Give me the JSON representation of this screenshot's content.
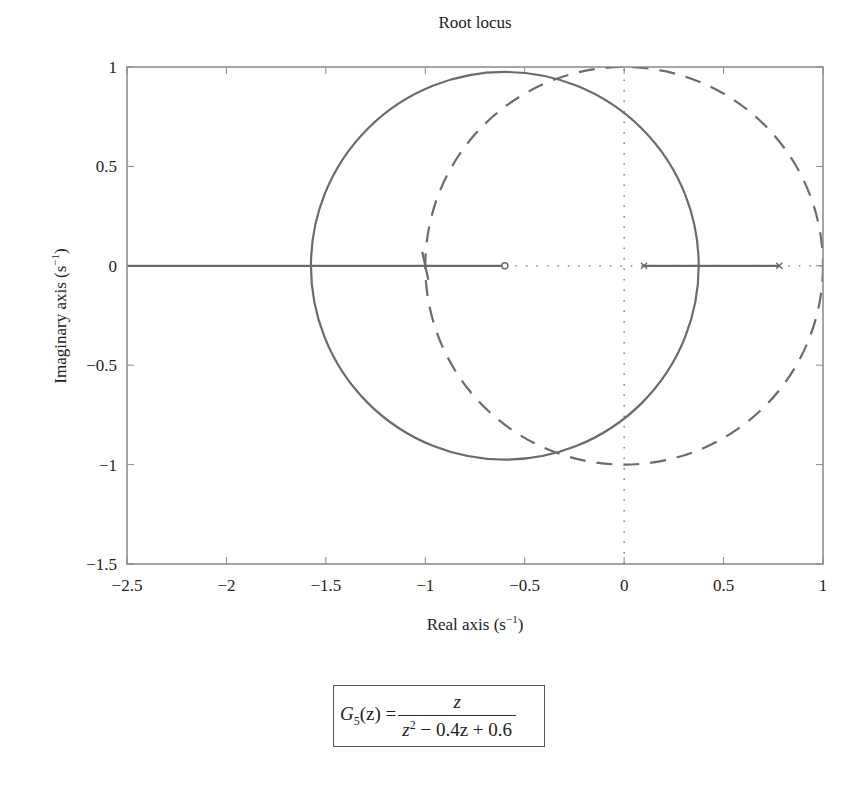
{
  "chart_data": {
    "type": "line",
    "title": "Root locus",
    "xlabel": "Real axis (s⁻¹)",
    "ylabel": "Imaginary axis (s⁻¹)",
    "xlim": [
      -2.5,
      1
    ],
    "ylim": [
      -1.5,
      1
    ],
    "xticks": [
      -2.5,
      -2,
      -1.5,
      -1,
      -0.5,
      0,
      0.5,
      1
    ],
    "xtick_labels": [
      "−2.5",
      "−2",
      "−1.5",
      "−1",
      "−0.5",
      "0",
      "0.5",
      "1"
    ],
    "yticks": [
      1,
      0.5,
      0,
      -0.5,
      -1,
      -1.5
    ],
    "ytick_labels": [
      "1",
      "0.5",
      "0",
      "−0.5",
      "−1",
      "−1.5"
    ],
    "grid": false,
    "series": [
      {
        "name": "root locus circle",
        "style": "solid",
        "shape": "circle",
        "center": [
          -0.6,
          0
        ],
        "radius": 0.975
      },
      {
        "name": "real-axis locus left",
        "style": "solid",
        "x": [
          -2.5,
          -0.6
        ],
        "y": [
          0,
          0
        ]
      },
      {
        "name": "real-axis locus right",
        "style": "solid",
        "x": [
          0.1,
          0.78
        ],
        "y": [
          0,
          0
        ]
      },
      {
        "name": "unit circle",
        "style": "dashed",
        "shape": "circle",
        "center": [
          0,
          0
        ],
        "radius": 1
      },
      {
        "name": "imaginary axis",
        "style": "dotted",
        "x": [
          0,
          0
        ],
        "y": [
          -1.5,
          1
        ]
      },
      {
        "name": "real axis",
        "style": "dotted",
        "x": [
          -0.6,
          1
        ],
        "y": [
          0,
          0
        ]
      }
    ],
    "markers": [
      {
        "type": "zero",
        "symbol": "o",
        "x": -0.6,
        "y": 0
      },
      {
        "type": "pole",
        "symbol": "x",
        "x": 0.1,
        "y": 0
      },
      {
        "type": "pole",
        "symbol": "x",
        "x": 0.78,
        "y": 0
      }
    ],
    "annotation": {
      "lhs": "G",
      "lhs_sub": "5",
      "lhs_arg": "(z) =",
      "numerator": "z",
      "denominator_a": "z",
      "denominator_sup": "2",
      "denominator_b": " − 0.4z + 0.6"
    }
  },
  "colors": {
    "line": "#6b6b6b",
    "axis": "#888888",
    "text": "#222222"
  }
}
